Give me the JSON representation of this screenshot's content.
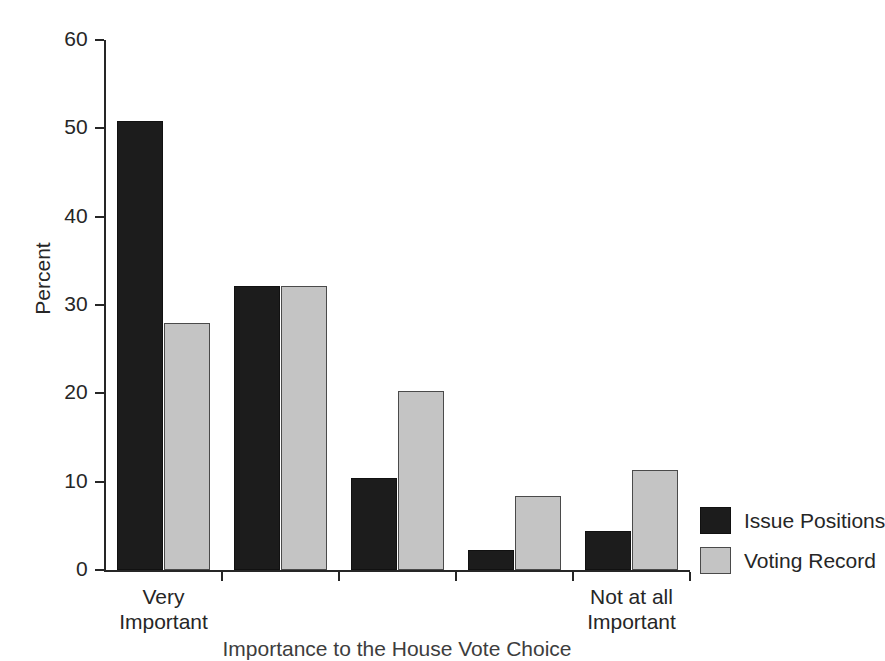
{
  "chart_data": {
    "type": "bar",
    "title": "",
    "xlabel": "Importance to the House Vote Choice",
    "ylabel": "Percent",
    "ylim": [
      0,
      60
    ],
    "yticks": [
      0,
      10,
      20,
      30,
      40,
      50,
      60
    ],
    "ytick_labels": [
      "0",
      "10",
      "20",
      "30",
      "40",
      "50",
      "60"
    ],
    "grid": false,
    "legend_position": "right",
    "categories": [
      "Very Important",
      "",
      "",
      "",
      "Not at all Important"
    ],
    "category_labels": [
      {
        "line1": "Very",
        "line2": "Important"
      },
      {
        "line1": "",
        "line2": ""
      },
      {
        "line1": "",
        "line2": ""
      },
      {
        "line1": "",
        "line2": ""
      },
      {
        "line1": "Not at all",
        "line2": "Important"
      }
    ],
    "series": [
      {
        "name": "Issue Positions",
        "color": "#1c1c1c",
        "values": [
          50.8,
          32.2,
          10.4,
          2.3,
          4.4
        ]
      },
      {
        "name": "Voting Record",
        "color": "#c4c4c4",
        "values": [
          28.0,
          32.2,
          20.3,
          8.4,
          11.3
        ]
      }
    ]
  },
  "legend": {
    "items": [
      {
        "label": "Issue Positions"
      },
      {
        "label": "Voting Record"
      }
    ]
  },
  "colors": {
    "axis": "#262626",
    "series_0": "#1c1c1c",
    "series_1": "#c4c4c4",
    "background": "#ffffff"
  }
}
